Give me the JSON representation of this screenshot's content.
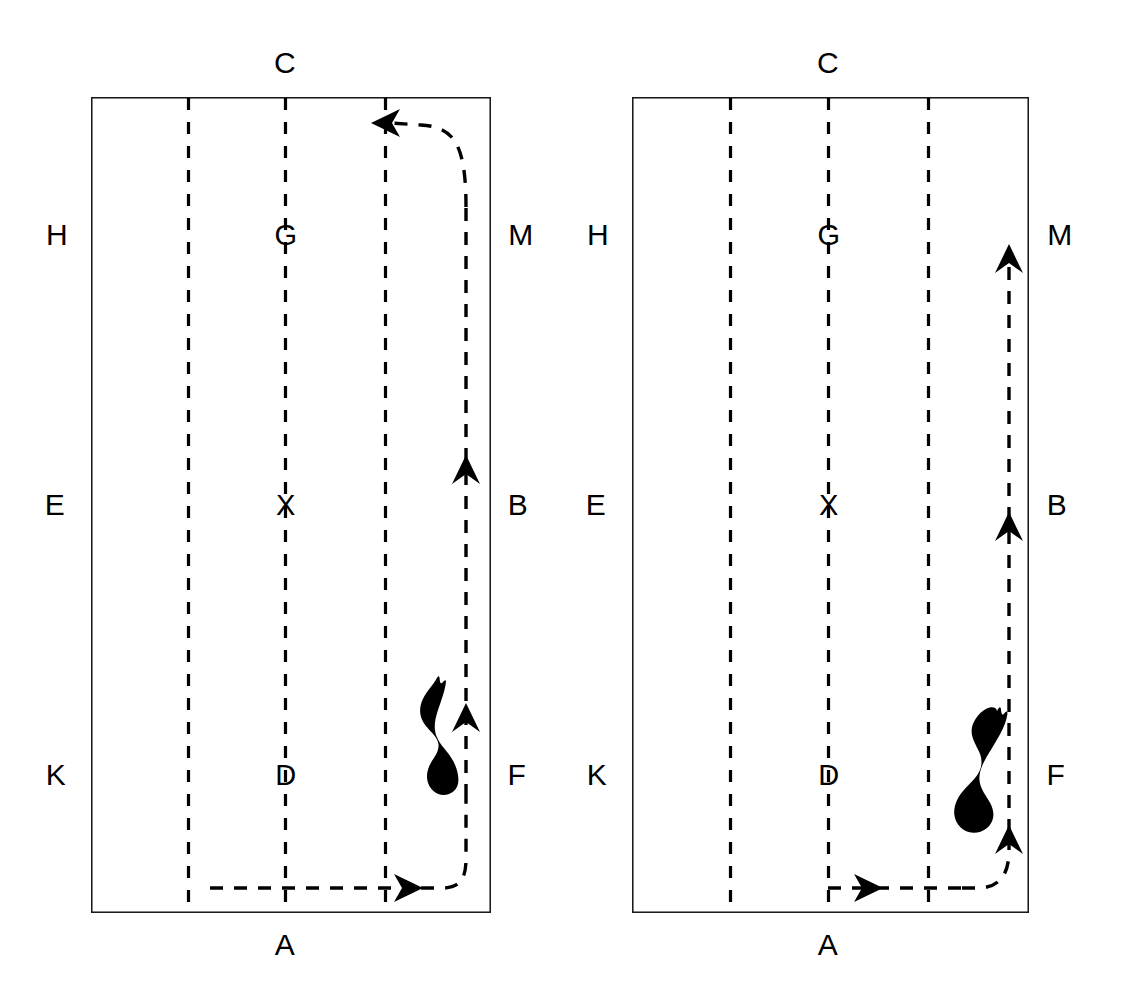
{
  "figure": {
    "type": "two-panel-arena-trajectory-diagram",
    "background_color": "#ffffff",
    "ink_color": "#000000",
    "width": 1122,
    "height": 993
  },
  "panels": [
    {
      "id": "left",
      "name": "left-panel",
      "rect": {
        "x": 91,
        "y": 97,
        "width": 400,
        "height": 816
      },
      "labels": {
        "top": "C",
        "bottom": "A",
        "left": [
          "H",
          "E",
          "K"
        ],
        "right": [
          "M",
          "B",
          "F"
        ],
        "interior": [
          "G",
          "X",
          "D"
        ]
      },
      "divider_fractions": [
        0.2425,
        0.485,
        0.735
      ],
      "interior_label_fraction": 0.485,
      "row_fractions": [
        0.169,
        0.5,
        0.831
      ],
      "trajectory": {
        "start": "bottom-left-entry",
        "end": "top-leftward-exit",
        "arrowheads": [
          "right",
          "up",
          "up",
          "left"
        ],
        "style": "dashed"
      },
      "animal": {
        "name": "animal-silhouette",
        "orientation": "head-up-slightly-left",
        "fill": "#000000"
      }
    },
    {
      "id": "right",
      "name": "right-panel",
      "rect": {
        "x": 632,
        "y": 97,
        "width": 397,
        "height": 816
      },
      "labels": {
        "top": "C",
        "bottom": "A",
        "left": [
          "H",
          "E",
          "K"
        ],
        "right": [
          "M",
          "B",
          "F"
        ],
        "interior": [
          "G",
          "X",
          "D"
        ]
      },
      "divider_fractions": [
        0.2465,
        0.4935,
        0.7455
      ],
      "interior_label_fraction": 0.4935,
      "row_fractions": [
        0.169,
        0.5,
        0.831
      ],
      "trajectory": {
        "start": "bottom-center-entry",
        "end": "top-upward-exit",
        "arrowheads": [
          "right",
          "up",
          "up",
          "up"
        ],
        "style": "dashed"
      },
      "animal": {
        "name": "animal-silhouette",
        "orientation": "head-up-right-tilted",
        "fill": "#000000"
      }
    }
  ],
  "label_positions": {
    "left_panel": {
      "C": {
        "x": 285,
        "y": 63
      },
      "A": {
        "x": 285,
        "y": 945
      },
      "H": {
        "x": 57,
        "y": 235
      },
      "E": {
        "x": 55,
        "y": 505
      },
      "K": {
        "x": 56,
        "y": 775
      },
      "M": {
        "x": 521,
        "y": 235
      },
      "B": {
        "x": 518,
        "y": 505
      },
      "F": {
        "x": 517,
        "y": 775
      },
      "G": {
        "x": 286,
        "y": 235
      },
      "X": {
        "x": 286,
        "y": 505
      },
      "D": {
        "x": 286,
        "y": 775
      }
    },
    "right_panel": {
      "C": {
        "x": 828,
        "y": 63
      },
      "A": {
        "x": 828,
        "y": 945
      },
      "H": {
        "x": 598,
        "y": 235
      },
      "E": {
        "x": 596,
        "y": 505
      },
      "K": {
        "x": 597,
        "y": 775
      },
      "M": {
        "x": 1060,
        "y": 235
      },
      "B": {
        "x": 1057,
        "y": 505
      },
      "F": {
        "x": 1056,
        "y": 775
      },
      "G": {
        "x": 829,
        "y": 235
      },
      "X": {
        "x": 829,
        "y": 505
      },
      "D": {
        "x": 829,
        "y": 775
      }
    }
  }
}
